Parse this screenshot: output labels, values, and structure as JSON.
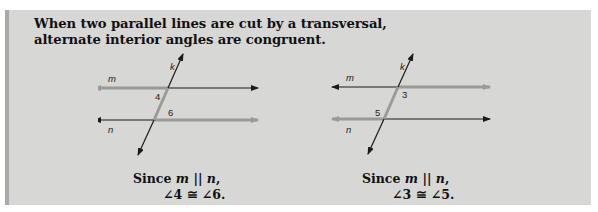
{
  "heading": {
    "line1": "When two parallel lines are cut by a transversal,",
    "line2": "alternate interior angles are congruent."
  },
  "diagrams": [
    {
      "labels": {
        "transversal": "k",
        "line_top": "m",
        "line_bottom": "n",
        "angle_a": "4",
        "angle_b": "6"
      },
      "caption": {
        "since": "Since",
        "var1": "m",
        "parallel": "||",
        "var2": "n",
        "comma": ",",
        "line2": "∠4 ≅ ∠6."
      }
    },
    {
      "labels": {
        "transversal": "k",
        "line_top": "m",
        "line_bottom": "n",
        "angle_a": "3",
        "angle_b": "5"
      },
      "caption": {
        "since": "Since",
        "var1": "m",
        "parallel": "||",
        "var2": "n",
        "comma": ",",
        "line2": "∠3 ≅ ∠5."
      }
    }
  ],
  "colors": {
    "background": "#d7d7d5",
    "highlight_line": "#9a9a98",
    "dark_line": "#1a1a1a"
  }
}
